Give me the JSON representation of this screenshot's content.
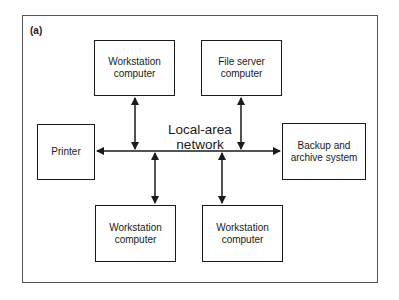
{
  "figure": {
    "label": "(a)",
    "network_label": "Local-area\nnetwork"
  },
  "nodes": {
    "workstation_top": "Workstation\ncomputer",
    "file_server": "File server\ncomputer",
    "printer": "Printer",
    "backup": "Backup and\narchive system",
    "workstation_bottom_left": "Workstation\ncomputer",
    "workstation_bottom_right": "Workstation\ncomputer"
  },
  "colors": {
    "line": "#1a1a1a",
    "frame": "#555555"
  }
}
